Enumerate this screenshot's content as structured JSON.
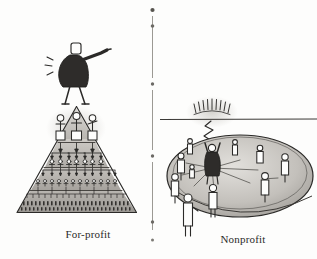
{
  "illustration": {
    "title": "For-profit versus Nonprofit organizational structures",
    "style": "hand-drawn pen and ink sketch, grayscale",
    "background_color": "#fdfdfc",
    "ink_color": "#2b2a28",
    "width": 317,
    "height": 259
  },
  "divider": {
    "name": "vertical-dotted-divider",
    "orientation": "vertical",
    "x": 152,
    "color": "#8d8b86",
    "dot_count": 6
  },
  "left_panel": {
    "caption": "For-profit",
    "caption_x": 88,
    "caption_y": 238,
    "shape": "pyramid",
    "leader": {
      "name": "boss-figure",
      "description": "dark-suited figure standing on apex, arm outstretched pointing, with emphasis marks",
      "pose": "pointing right"
    },
    "tiers": [
      {
        "index": 1,
        "label": "executives",
        "figure_count": 3,
        "figure_scale": 1.0
      },
      {
        "index": 2,
        "label": "managers",
        "figure_count": 9,
        "figure_scale": 0.55
      },
      {
        "index": 3,
        "label": "supervisors",
        "figure_count": 14,
        "figure_scale": 0.4
      },
      {
        "index": 4,
        "label": "workers",
        "figure_count": 30,
        "figure_scale": 0.22
      }
    ],
    "flow": "top-down command arrows",
    "arrow_direction": "downward"
  },
  "right_panel": {
    "caption": "Nonprofit",
    "caption_x": 243,
    "caption_y": 243,
    "shape": "ellipse",
    "horizon": {
      "name": "horizon-line",
      "y": 119,
      "x_start": 160,
      "x_end": 317
    },
    "inspiration": {
      "name": "sunburst-rays",
      "description": "radiating arc of light rays above the horizon line",
      "ray_count": 9,
      "center_x": 212,
      "center_y": 112
    },
    "connector": {
      "name": "squiggle-connector",
      "description": "zigzag line descending from the light to the central figure"
    },
    "center_figure": {
      "name": "central-dark-figure",
      "description": "dark filled figure at the hub with arms raised, receiving the light"
    },
    "circle_figures": 9,
    "outside_figure": {
      "name": "outside-observer-figure",
      "description": "figure standing outside the lower-left edge of the ellipse"
    },
    "flow": "radial spokes outward from the center",
    "spoke_count": 6
  }
}
